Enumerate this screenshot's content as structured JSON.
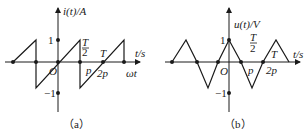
{
  "figure_a": {
    "ylabel": "i(t)/A",
    "xlabel_top": "t/s",
    "xlabel_bottom": "ωt",
    "tick_pos": "1",
    "tick_neg": "−1",
    "origin": "O",
    "label_half_T_num": "T",
    "label_half_T_den": "2",
    "label_T": "T",
    "label_pi": "p",
    "label_2pi": "2p",
    "caption": "（a）"
  },
  "figure_b": {
    "ylabel": "u(t)/V",
    "xlabel": "t/s",
    "tick_pos": "1",
    "tick_neg": "−1",
    "origin": "O",
    "label_half_T_num": "T",
    "label_half_T_den": "2",
    "label_T": "T",
    "label_pi": "p",
    "label_2pi": "2p",
    "caption": "（b）"
  },
  "colors": {
    "ink": "#1a1a1a",
    "background": "#ffffff"
  }
}
